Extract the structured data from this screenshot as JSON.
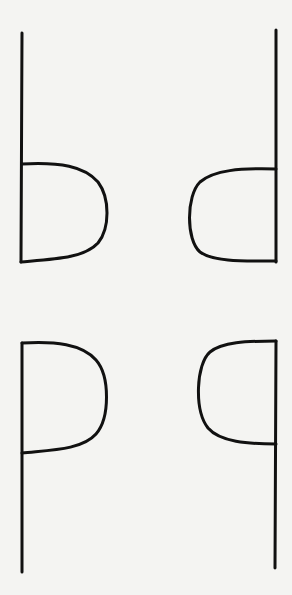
{
  "diagram": {
    "stroke_color": "#111111",
    "background_color": "#f4f4f2",
    "glyphs": [
      {
        "letter": "b",
        "position": "top-left"
      },
      {
        "letter": "d",
        "position": "top-right"
      },
      {
        "letter": "p",
        "position": "bottom-left"
      },
      {
        "letter": "q",
        "position": "bottom-right"
      }
    ]
  }
}
